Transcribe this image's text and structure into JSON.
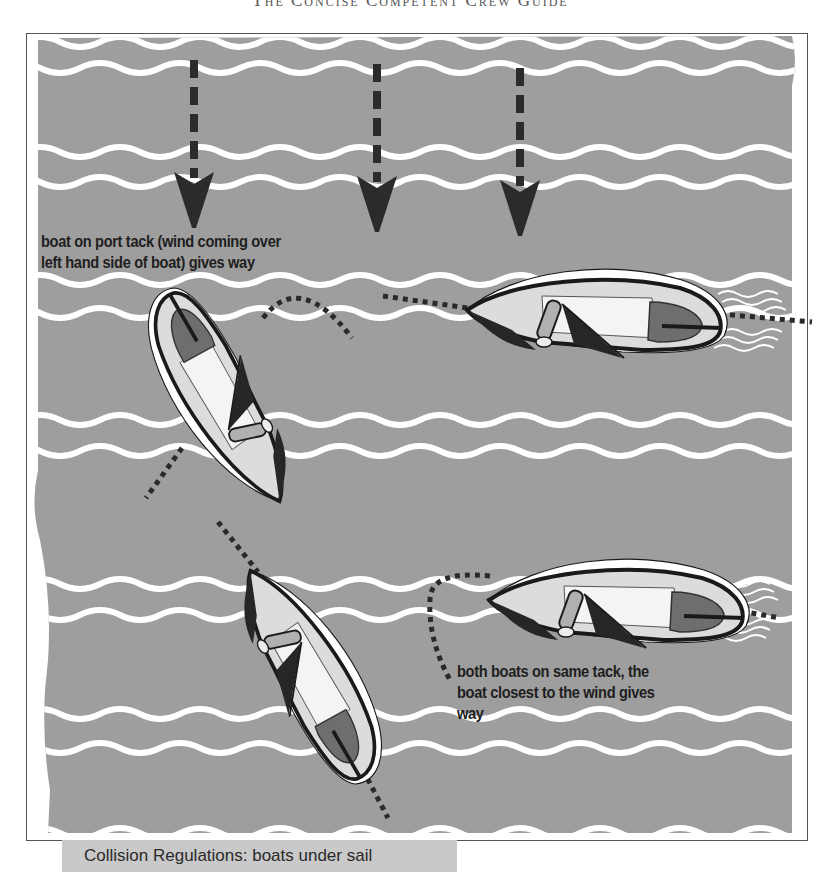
{
  "page": {
    "running_head": "The Concise Competent Crew Guide"
  },
  "figure": {
    "caption": "Collision Regulations: boats under sail",
    "colors": {
      "sea": "#9e9e9e",
      "wave": "#ffffff",
      "arrow": "#2b2b2b",
      "hull_outline": "#1a1a1a",
      "deck": "#dcdcdc",
      "cockpit": "#f4f4f4",
      "sail": "#262626",
      "cabin": "#6e6e6e",
      "caption_bg": "#c9c9c9"
    },
    "wind_arrows": [
      {
        "name": "wind-arrow-1",
        "x": 194,
        "y_top": 60,
        "y_tip": 220
      },
      {
        "name": "wind-arrow-2",
        "x": 377,
        "y_top": 60,
        "y_tip": 222
      },
      {
        "name": "wind-arrow-3",
        "x": 520,
        "y_top": 60,
        "y_tip": 228
      }
    ],
    "annotations": {
      "port_tack": {
        "line1": "boat on port tack (wind coming over",
        "line2": "left hand side of boat) gives way"
      },
      "same_tack": {
        "line1": "both boats on same tack, the",
        "line2": "boat closest to the wind gives",
        "line3": "way"
      }
    },
    "boats": [
      {
        "name": "boat-starboard-tack-upper",
        "role": "stand-on (starboard tack)",
        "cx": 590,
        "cy": 318,
        "angle": 0
      },
      {
        "name": "boat-port-tack",
        "role": "give-way (port tack)",
        "cx": 225,
        "cy": 395,
        "angle": -62
      },
      {
        "name": "boat-windward",
        "role": "give-way (windward boat)",
        "cx": 310,
        "cy": 690,
        "angle": 58
      },
      {
        "name": "boat-leeward",
        "role": "stand-on (leeward boat)",
        "cx": 615,
        "cy": 597,
        "angle": 0
      }
    ],
    "wave_rows_y": [
      42,
      68,
      152,
      182,
      280,
      313,
      420,
      451,
      584,
      615,
      714,
      748,
      833
    ]
  }
}
